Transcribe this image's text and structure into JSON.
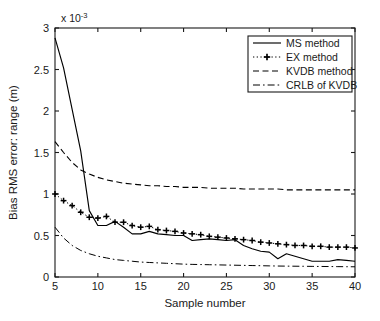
{
  "chart_data": {
    "type": "line",
    "title": "",
    "xlabel": "Sample number",
    "ylabel": "Bias RMS error: range (m)",
    "exponent_label": "x 10",
    "exponent_power": "-3",
    "y_scale_factor": 0.001,
    "xlim": [
      5,
      40
    ],
    "ylim": [
      0,
      3
    ],
    "xticks": [
      5,
      10,
      15,
      20,
      25,
      30,
      35,
      40
    ],
    "xtick_labels": [
      "5",
      "10",
      "15",
      "20",
      "25",
      "30",
      "35",
      "40"
    ],
    "yticks": [
      0,
      0.5,
      1,
      1.5,
      2,
      2.5,
      3
    ],
    "ytick_labels": [
      "0",
      "0.5",
      "1",
      "1.5",
      "2",
      "2.5",
      "3"
    ],
    "grid": false,
    "legend_position": "top-right",
    "x": [
      5,
      6,
      7,
      8,
      9,
      10,
      11,
      12,
      13,
      14,
      15,
      16,
      17,
      18,
      19,
      20,
      21,
      22,
      23,
      24,
      25,
      26,
      27,
      28,
      29,
      30,
      31,
      32,
      33,
      34,
      35,
      36,
      37,
      38,
      39,
      40
    ],
    "series": [
      {
        "name": "MS method",
        "style": "solid",
        "marker": "none",
        "values": [
          2.88,
          2.52,
          2.02,
          1.52,
          0.8,
          0.62,
          0.62,
          0.67,
          0.6,
          0.52,
          0.52,
          0.55,
          0.52,
          0.51,
          0.5,
          0.5,
          0.44,
          0.45,
          0.46,
          0.45,
          0.44,
          0.45,
          0.38,
          0.34,
          0.31,
          0.3,
          0.22,
          0.28,
          0.25,
          0.22,
          0.19,
          0.19,
          0.19,
          0.21,
          0.2,
          0.19
        ]
      },
      {
        "name": "EX method",
        "style": "dotted",
        "marker": "plus",
        "values": [
          1.0,
          0.92,
          0.86,
          0.78,
          0.72,
          0.71,
          0.73,
          0.66,
          0.66,
          0.62,
          0.6,
          0.61,
          0.57,
          0.56,
          0.55,
          0.53,
          0.52,
          0.51,
          0.49,
          0.48,
          0.47,
          0.46,
          0.45,
          0.44,
          0.42,
          0.41,
          0.4,
          0.39,
          0.38,
          0.38,
          0.37,
          0.37,
          0.36,
          0.36,
          0.36,
          0.35
        ]
      },
      {
        "name": "KVDB method",
        "style": "dashed",
        "marker": "none",
        "values": [
          1.63,
          1.5,
          1.38,
          1.29,
          1.24,
          1.2,
          1.17,
          1.15,
          1.13,
          1.12,
          1.11,
          1.1,
          1.1,
          1.09,
          1.09,
          1.08,
          1.08,
          1.08,
          1.07,
          1.07,
          1.07,
          1.07,
          1.06,
          1.06,
          1.06,
          1.06,
          1.06,
          1.05,
          1.05,
          1.05,
          1.05,
          1.05,
          1.05,
          1.05,
          1.05,
          1.05
        ]
      },
      {
        "name": "CRLB of KVDB",
        "style": "dashdot",
        "marker": "none",
        "values": [
          0.6,
          0.47,
          0.38,
          0.32,
          0.28,
          0.25,
          0.23,
          0.21,
          0.2,
          0.19,
          0.18,
          0.175,
          0.17,
          0.165,
          0.16,
          0.155,
          0.152,
          0.15,
          0.148,
          0.146,
          0.144,
          0.142,
          0.14,
          0.138,
          0.136,
          0.134,
          0.132,
          0.131,
          0.13,
          0.129,
          0.128,
          0.127,
          0.126,
          0.125,
          0.124,
          0.123
        ]
      }
    ],
    "legend": [
      {
        "label": "MS method",
        "style": "solid",
        "marker": "none"
      },
      {
        "label": "EX method",
        "style": "dotted",
        "marker": "plus"
      },
      {
        "label": "KVDB method",
        "style": "dashed",
        "marker": "none"
      },
      {
        "label": "CRLB of KVDB",
        "style": "dashdot",
        "marker": "none"
      }
    ]
  }
}
